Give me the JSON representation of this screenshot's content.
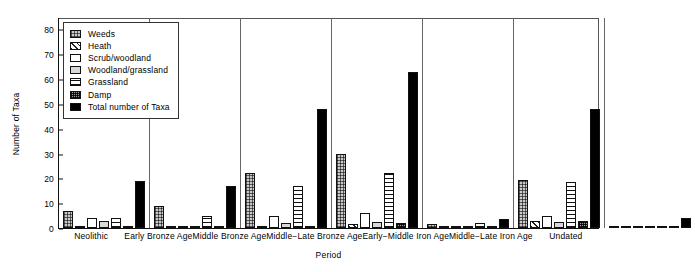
{
  "chart_data": {
    "type": "bar",
    "title": "",
    "xlabel": "Period",
    "ylabel": "Number of Taxa",
    "ylim": [
      0,
      85
    ],
    "yticks": [
      0,
      10,
      20,
      30,
      40,
      50,
      60,
      70,
      80
    ],
    "grid": false,
    "legend_position": "upper-left-inside",
    "categories": [
      "Neolithic",
      "Early Bronze Age",
      "Middle Bronze Age",
      "Middle−Late Bronze Age",
      "Early−Middle Iron Age",
      "Middle−Late Iron Age",
      "Undated"
    ],
    "series": [
      {
        "name": "Weeds",
        "pattern": "dotted-checker",
        "values": [
          7,
          9,
          22,
          30,
          1.5,
          19.5,
          1
        ]
      },
      {
        "name": "Heath",
        "pattern": "diagonal-hatch",
        "values": [
          1,
          1,
          1,
          1.5,
          0,
          3,
          0
        ]
      },
      {
        "name": "Scrub/woodland",
        "pattern": "white",
        "values": [
          4,
          0.5,
          5,
          6,
          0,
          5,
          1
        ]
      },
      {
        "name": "Woodland/grassland",
        "pattern": "light-grey",
        "values": [
          3,
          1,
          2,
          2.5,
          0,
          2.5,
          1
        ]
      },
      {
        "name": "Grassland",
        "pattern": "horizontal-lines",
        "values": [
          4,
          5,
          17,
          22,
          2,
          18.5,
          0
        ]
      },
      {
        "name": "Damp",
        "pattern": "dense-checker",
        "values": [
          0.5,
          0.5,
          1,
          2,
          0,
          3,
          0
        ]
      },
      {
        "name": "Total number of Taxa",
        "pattern": "solid-black",
        "values": [
          19,
          17,
          48,
          63,
          3.5,
          48,
          4
        ]
      }
    ]
  },
  "legend": {
    "items": [
      {
        "label": "Weeds"
      },
      {
        "label": "Heath"
      },
      {
        "label": "Scrub/woodland"
      },
      {
        "label": "Woodland/grassland"
      },
      {
        "label": "Grassland"
      },
      {
        "label": "Damp"
      },
      {
        "label": "Total number of Taxa"
      }
    ]
  },
  "axes": {
    "y_title": "Number of Taxa",
    "x_title": "Period",
    "y_tick_labels": [
      "0",
      "10",
      "20",
      "30",
      "40",
      "50",
      "60",
      "70",
      "80"
    ]
  },
  "corner_mark": "",
  "colors": {
    "axis": "#111111",
    "separator": "#666666",
    "total_bar": "#000000",
    "woodland_grassland": "#d8d8d8",
    "weeds": "#c9c9c9",
    "damp": "#9a9a9a",
    "background": "#ffffff"
  }
}
